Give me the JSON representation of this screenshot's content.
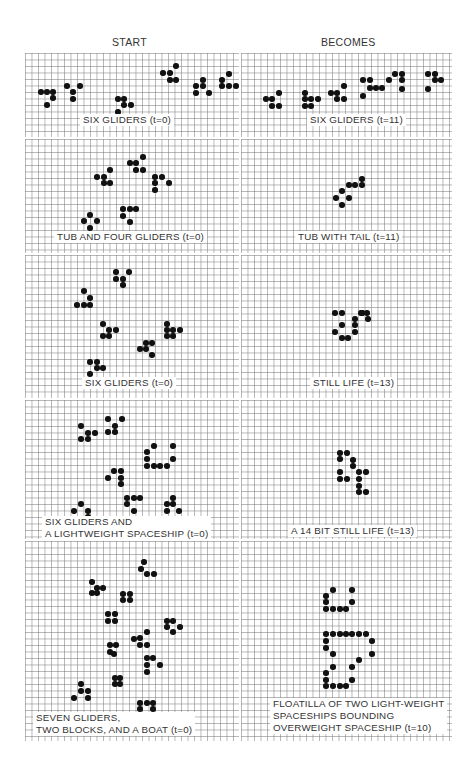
{
  "headers": {
    "left": "START",
    "right": "BECOMES"
  },
  "panels": [
    {
      "id": "p1l",
      "box": [
        25,
        53,
        214,
        84
      ],
      "caption": "SIX GLIDERS (t=0)",
      "cap_pos": [
        80,
        120
      ],
      "dots": [
        [
          41,
          92
        ],
        [
          47,
          92
        ],
        [
          53,
          92
        ],
        [
          53,
          98
        ],
        [
          47,
          105
        ],
        [
          67,
          86
        ],
        [
          80,
          86
        ],
        [
          73,
          92
        ],
        [
          73,
          99
        ],
        [
          118,
          99
        ],
        [
          124,
          99
        ],
        [
          124,
          105
        ],
        [
          131,
          105
        ],
        [
          118,
          112
        ],
        [
          163,
          73
        ],
        [
          170,
          73
        ],
        [
          176,
          66
        ],
        [
          170,
          80
        ],
        [
          176,
          80
        ],
        [
          196,
          86
        ],
        [
          203,
          80
        ],
        [
          203,
          86
        ],
        [
          196,
          93
        ],
        [
          209,
          93
        ],
        [
          222,
          80
        ],
        [
          229,
          74
        ],
        [
          222,
          86
        ],
        [
          229,
          86
        ],
        [
          236,
          86
        ]
      ]
    },
    {
      "id": "p1r",
      "box": [
        241,
        53,
        211,
        84
      ],
      "caption": "SIX GLIDERS (t=11)",
      "cap_pos": [
        307,
        120
      ],
      "dots": [
        [
          266,
          99
        ],
        [
          272,
          99
        ],
        [
          279,
          93
        ],
        [
          272,
          106
        ],
        [
          279,
          106
        ],
        [
          305,
          93
        ],
        [
          305,
          99
        ],
        [
          311,
          99
        ],
        [
          305,
          106
        ],
        [
          311,
          106
        ],
        [
          318,
          99
        ],
        [
          331,
          93
        ],
        [
          337,
          93
        ],
        [
          344,
          86
        ],
        [
          337,
          99
        ],
        [
          344,
          99
        ],
        [
          363,
          80
        ],
        [
          370,
          80
        ],
        [
          370,
          88
        ],
        [
          376,
          88
        ],
        [
          382,
          88
        ],
        [
          363,
          96
        ],
        [
          389,
          80
        ],
        [
          395,
          74
        ],
        [
          402,
          74
        ],
        [
          402,
          80
        ],
        [
          402,
          89
        ],
        [
          428,
          74
        ],
        [
          435,
          74
        ],
        [
          435,
          80
        ],
        [
          441,
          80
        ],
        [
          428,
          89
        ]
      ]
    },
    {
      "id": "p2l",
      "box": [
        25,
        139,
        214,
        114
      ],
      "caption": "TUB AND FOUR GLIDERS (t=0)",
      "cap_pos": [
        54,
        237
      ],
      "dots": [
        [
          97,
          177
        ],
        [
          104,
          177
        ],
        [
          110,
          170
        ],
        [
          104,
          183
        ],
        [
          110,
          183
        ],
        [
          130,
          163
        ],
        [
          136,
          163
        ],
        [
          143,
          157
        ],
        [
          136,
          170
        ],
        [
          143,
          170
        ],
        [
          155,
          177
        ],
        [
          162,
          177
        ],
        [
          155,
          183
        ],
        [
          169,
          183
        ],
        [
          155,
          190
        ],
        [
          123,
          209
        ],
        [
          130,
          209
        ],
        [
          136,
          209
        ],
        [
          123,
          216
        ],
        [
          130,
          222
        ],
        [
          90,
          215
        ],
        [
          84,
          221
        ],
        [
          97,
          221
        ],
        [
          90,
          228
        ]
      ]
    },
    {
      "id": "p2r",
      "box": [
        241,
        139,
        211,
        114
      ],
      "caption": "TUB WITH TAIL (t=11)",
      "cap_pos": [
        295,
        237
      ],
      "dots": [
        [
          362,
          179
        ],
        [
          349,
          185
        ],
        [
          355,
          185
        ],
        [
          362,
          185
        ],
        [
          342,
          191
        ],
        [
          336,
          198
        ],
        [
          349,
          198
        ],
        [
          342,
          205
        ]
      ]
    },
    {
      "id": "p3l",
      "box": [
        25,
        255,
        214,
        143
      ],
      "caption": "SIX GLIDERS (t=0)",
      "cap_pos": [
        82,
        383
      ],
      "dots": [
        [
          116,
          272
        ],
        [
          129,
          272
        ],
        [
          116,
          279
        ],
        [
          123,
          279
        ],
        [
          123,
          285
        ],
        [
          84,
          291
        ],
        [
          90,
          298
        ],
        [
          77,
          305
        ],
        [
          84,
          305
        ],
        [
          90,
          305
        ],
        [
          103,
          324
        ],
        [
          109,
          330
        ],
        [
          116,
          330
        ],
        [
          103,
          336
        ],
        [
          109,
          336
        ],
        [
          146,
          343
        ],
        [
          152,
          343
        ],
        [
          140,
          349
        ],
        [
          146,
          349
        ],
        [
          152,
          355
        ],
        [
          167,
          324
        ],
        [
          167,
          330
        ],
        [
          173,
          330
        ],
        [
          167,
          336
        ],
        [
          173,
          336
        ],
        [
          180,
          330
        ],
        [
          90,
          362
        ],
        [
          97,
          362
        ],
        [
          97,
          368
        ],
        [
          103,
          368
        ],
        [
          90,
          374
        ]
      ]
    },
    {
      "id": "p3r",
      "box": [
        241,
        255,
        211,
        143
      ],
      "caption": "STILL LIFE (t=13)",
      "cap_pos": [
        310,
        383
      ],
      "dots": [
        [
          335,
          313
        ],
        [
          342,
          313
        ],
        [
          361,
          313
        ],
        [
          342,
          325
        ],
        [
          355,
          319
        ],
        [
          355,
          325
        ],
        [
          335,
          332
        ],
        [
          355,
          332
        ],
        [
          342,
          338
        ],
        [
          348,
          338
        ],
        [
          362,
          313
        ],
        [
          367,
          313
        ],
        [
          368,
          319
        ],
        [
          362,
          313
        ]
      ]
    },
    {
      "id": "p4l",
      "box": [
        25,
        400,
        214,
        139
      ],
      "caption": "SIX GLIDERS AND\nA LIGHTWEIGHT SPACESHIP (t=0)",
      "cap_pos": [
        42,
        522
      ],
      "dots": [
        [
          81,
          426
        ],
        [
          88,
          433
        ],
        [
          95,
          433
        ],
        [
          81,
          439
        ],
        [
          88,
          439
        ],
        [
          108,
          419
        ],
        [
          122,
          419
        ],
        [
          115,
          426
        ],
        [
          108,
          432
        ],
        [
          115,
          432
        ],
        [
          154,
          446
        ],
        [
          147,
          452
        ],
        [
          173,
          446
        ],
        [
          147,
          459
        ],
        [
          173,
          459
        ],
        [
          147,
          466
        ],
        [
          154,
          466
        ],
        [
          160,
          466
        ],
        [
          167,
          466
        ],
        [
          114,
          471
        ],
        [
          121,
          471
        ],
        [
          108,
          478
        ],
        [
          121,
          478
        ],
        [
          121,
          484
        ],
        [
          127,
          498
        ],
        [
          134,
          498
        ],
        [
          140,
          498
        ],
        [
          127,
          504
        ],
        [
          134,
          511
        ],
        [
          173,
          498
        ],
        [
          167,
          504
        ],
        [
          173,
          504
        ],
        [
          167,
          511
        ],
        [
          179,
          511
        ],
        [
          81,
          504
        ],
        [
          88,
          511
        ],
        [
          74,
          511
        ],
        [
          88,
          517
        ]
      ]
    },
    {
      "id": "p4r",
      "box": [
        241,
        400,
        211,
        139
      ],
      "caption": "A 14 BIT STILL LIFE (t=13)",
      "cap_pos": [
        288,
        531
      ],
      "dots": [
        [
          340,
          453
        ],
        [
          347,
          453
        ],
        [
          340,
          459
        ],
        [
          353,
          460
        ],
        [
          353,
          466
        ],
        [
          340,
          472
        ],
        [
          359,
          472
        ],
        [
          366,
          472
        ],
        [
          340,
          479
        ],
        [
          347,
          479
        ],
        [
          359,
          479
        ],
        [
          359,
          486
        ],
        [
          359,
          492
        ],
        [
          366,
          492
        ]
      ]
    },
    {
      "id": "p5l",
      "box": [
        25,
        541,
        214,
        200
      ],
      "caption": "SEVEN GLIDERS,\nTWO BLOCKS, AND A BOAT (t=0)",
      "cap_pos": [
        33,
        718
      ],
      "dots": [
        [
          144,
          562
        ],
        [
          141,
          569
        ],
        [
          147,
          574
        ],
        [
          154,
          574
        ],
        [
          92,
          582
        ],
        [
          97,
          588
        ],
        [
          103,
          588
        ],
        [
          92,
          593
        ],
        [
          97,
          593
        ],
        [
          123,
          594
        ],
        [
          130,
          594
        ],
        [
          123,
          600
        ],
        [
          130,
          600
        ],
        [
          167,
          621
        ],
        [
          173,
          621
        ],
        [
          167,
          627
        ],
        [
          180,
          627
        ],
        [
          173,
          632
        ],
        [
          108,
          614
        ],
        [
          115,
          614
        ],
        [
          108,
          621
        ],
        [
          115,
          621
        ],
        [
          140,
          638
        ],
        [
          147,
          632
        ],
        [
          134,
          639
        ],
        [
          140,
          645
        ],
        [
          147,
          645
        ],
        [
          110,
          645
        ],
        [
          116,
          645
        ],
        [
          110,
          652
        ],
        [
          114,
          654
        ],
        [
          147,
          658
        ],
        [
          153,
          658
        ],
        [
          147,
          665
        ],
        [
          160,
          665
        ],
        [
          147,
          672
        ],
        [
          81,
          684
        ],
        [
          81,
          691
        ],
        [
          88,
          691
        ],
        [
          74,
          698
        ],
        [
          88,
          698
        ],
        [
          115,
          678
        ],
        [
          120,
          678
        ],
        [
          115,
          684
        ],
        [
          120,
          684
        ],
        [
          140,
          703
        ],
        [
          147,
          703
        ],
        [
          153,
          703
        ],
        [
          140,
          709
        ],
        [
          153,
          709
        ],
        [
          140,
          716
        ]
      ]
    },
    {
      "id": "p5r",
      "box": [
        241,
        541,
        211,
        200
      ],
      "caption": "FLOATILLA OF TWO LIGHT-WEIGHT\nSPACESHIPS BOUNDING\nOVERWEIGHT SPACESHIP (t=10)",
      "cap_pos": [
        270,
        704
      ],
      "dots": [
        [
          333,
          590
        ],
        [
          352,
          590
        ],
        [
          326,
          596
        ],
        [
          326,
          602
        ],
        [
          352,
          602
        ],
        [
          326,
          609
        ],
        [
          333,
          609
        ],
        [
          340,
          609
        ],
        [
          346,
          609
        ],
        [
          326,
          634
        ],
        [
          333,
          634
        ],
        [
          340,
          634
        ],
        [
          346,
          634
        ],
        [
          352,
          634
        ],
        [
          359,
          634
        ],
        [
          366,
          634
        ],
        [
          326,
          641
        ],
        [
          372,
          641
        ],
        [
          326,
          648
        ],
        [
          333,
          654
        ],
        [
          372,
          654
        ],
        [
          359,
          660
        ],
        [
          333,
          667
        ],
        [
          352,
          667
        ],
        [
          326,
          673
        ],
        [
          326,
          680
        ],
        [
          352,
          680
        ],
        [
          326,
          686
        ],
        [
          333,
          686
        ],
        [
          340,
          686
        ],
        [
          346,
          686
        ]
      ]
    }
  ]
}
